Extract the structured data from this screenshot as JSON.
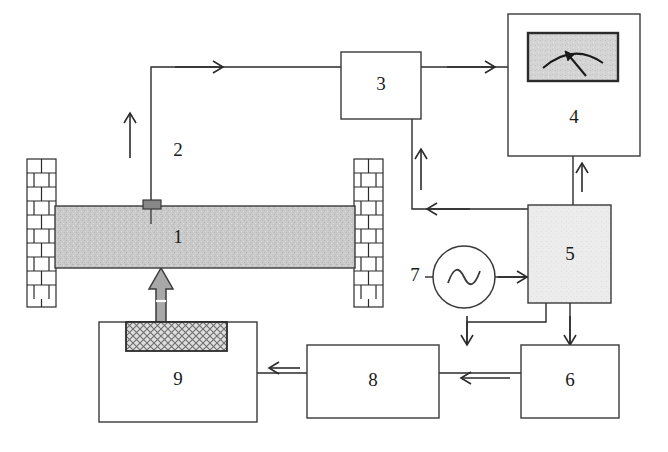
{
  "diagram": {
    "background_color": "#ffffff",
    "line_color": "#2b2b2b",
    "beam_fill": "#c9c9c9",
    "block5_fill": "#ececec",
    "meter_face_fill": "#d4d4d4",
    "actuator_fill": "#d8d8d8",
    "arrow_fill": "#a8a8a8",
    "sensor_fill": "#888888",
    "components": [
      {
        "id": "1",
        "label": "1",
        "name": "beam-specimen",
        "kind": "textured-beam",
        "x": 55,
        "y": 206,
        "width": 300,
        "height": 62
      },
      {
        "id": "2",
        "label": "2",
        "name": "signal-cable-from-sensor",
        "kind": "wire-label",
        "x": 178,
        "y": 152
      },
      {
        "id": "3",
        "label": "3",
        "name": "charge-amplifier",
        "kind": "box",
        "x": 341,
        "y": 52,
        "width": 80,
        "height": 67
      },
      {
        "id": "4",
        "label": "4",
        "name": "analog-meter-display",
        "kind": "box-with-gauge",
        "x": 508,
        "y": 14,
        "width": 132,
        "height": 142
      },
      {
        "id": "5",
        "label": "5",
        "name": "signal-conditioning-unit",
        "kind": "filled-box",
        "x": 528,
        "y": 205,
        "width": 83,
        "height": 98
      },
      {
        "id": "6",
        "label": "6",
        "name": "controller-unit",
        "kind": "box",
        "x": 521,
        "y": 345,
        "width": 98,
        "height": 73
      },
      {
        "id": "7",
        "label": "7",
        "name": "signal-generator-oscillator",
        "kind": "circle-sine-source",
        "cx": 464,
        "cy": 277,
        "r": 31
      },
      {
        "id": "8",
        "label": "8",
        "name": "power-amplifier",
        "kind": "box",
        "x": 307,
        "y": 345,
        "width": 132,
        "height": 73
      },
      {
        "id": "9",
        "label": "9",
        "name": "exciter-shaker-unit",
        "kind": "box-with-actuator",
        "x": 99,
        "y": 322,
        "width": 158,
        "height": 100
      }
    ],
    "supports": [
      {
        "name": "brick-wall-support-left",
        "x": 27,
        "y": 159,
        "width": 29,
        "height": 148
      },
      {
        "name": "brick-wall-support-right",
        "x": 354,
        "y": 159,
        "width": 29,
        "height": 148
      }
    ],
    "sensor": {
      "name": "accelerometer-sensor",
      "x": 143,
      "y": 200,
      "width": 18,
      "height": 9
    },
    "actuator_block": {
      "name": "hatched-actuator-block",
      "x": 126,
      "y": 322,
      "width": 101,
      "height": 29
    },
    "excitation_arrow": {
      "name": "excitation-force-arrow",
      "direction": "up",
      "x": 161,
      "y": 268,
      "height": 55
    },
    "gauge": {
      "name": "meter-gauge-face",
      "x": 528,
      "y": 33,
      "width": 90,
      "height": 48,
      "needle_direction": "up-left"
    },
    "flow_arrows": [
      {
        "name": "flow-arrow-sensor-to-amp",
        "direction": "right",
        "x": 175,
        "y": 67
      },
      {
        "name": "flow-arrow-cable-up",
        "direction": "up",
        "x": 130,
        "y": 120
      },
      {
        "name": "flow-arrow-amp-to-meter",
        "direction": "right",
        "x": 447,
        "y": 67
      },
      {
        "name": "flow-arrow-unit5-to-meter",
        "direction": "up",
        "x": 573,
        "y": 170
      },
      {
        "name": "flow-arrow-unit5-feedback-left",
        "direction": "left",
        "x": 430,
        "y": 209
      },
      {
        "name": "flow-arrow-amp-down-riser",
        "direction": "up",
        "x": 412,
        "y": 148
      },
      {
        "name": "flow-arrow-osc-to-unit5",
        "direction": "right",
        "x": 505,
        "y": 277
      },
      {
        "name": "flow-arrow-unit5-to-amp8",
        "direction": "down",
        "x": 467,
        "y": 330
      },
      {
        "name": "flow-arrow-unit5-to-unit6",
        "direction": "down",
        "x": 570,
        "y": 330
      },
      {
        "name": "flow-arrow-unit6-to-unit8",
        "direction": "left",
        "x": 480,
        "y": 373
      },
      {
        "name": "flow-arrow-unit8-to-unit9",
        "direction": "left",
        "x": 282,
        "y": 373
      }
    ]
  }
}
